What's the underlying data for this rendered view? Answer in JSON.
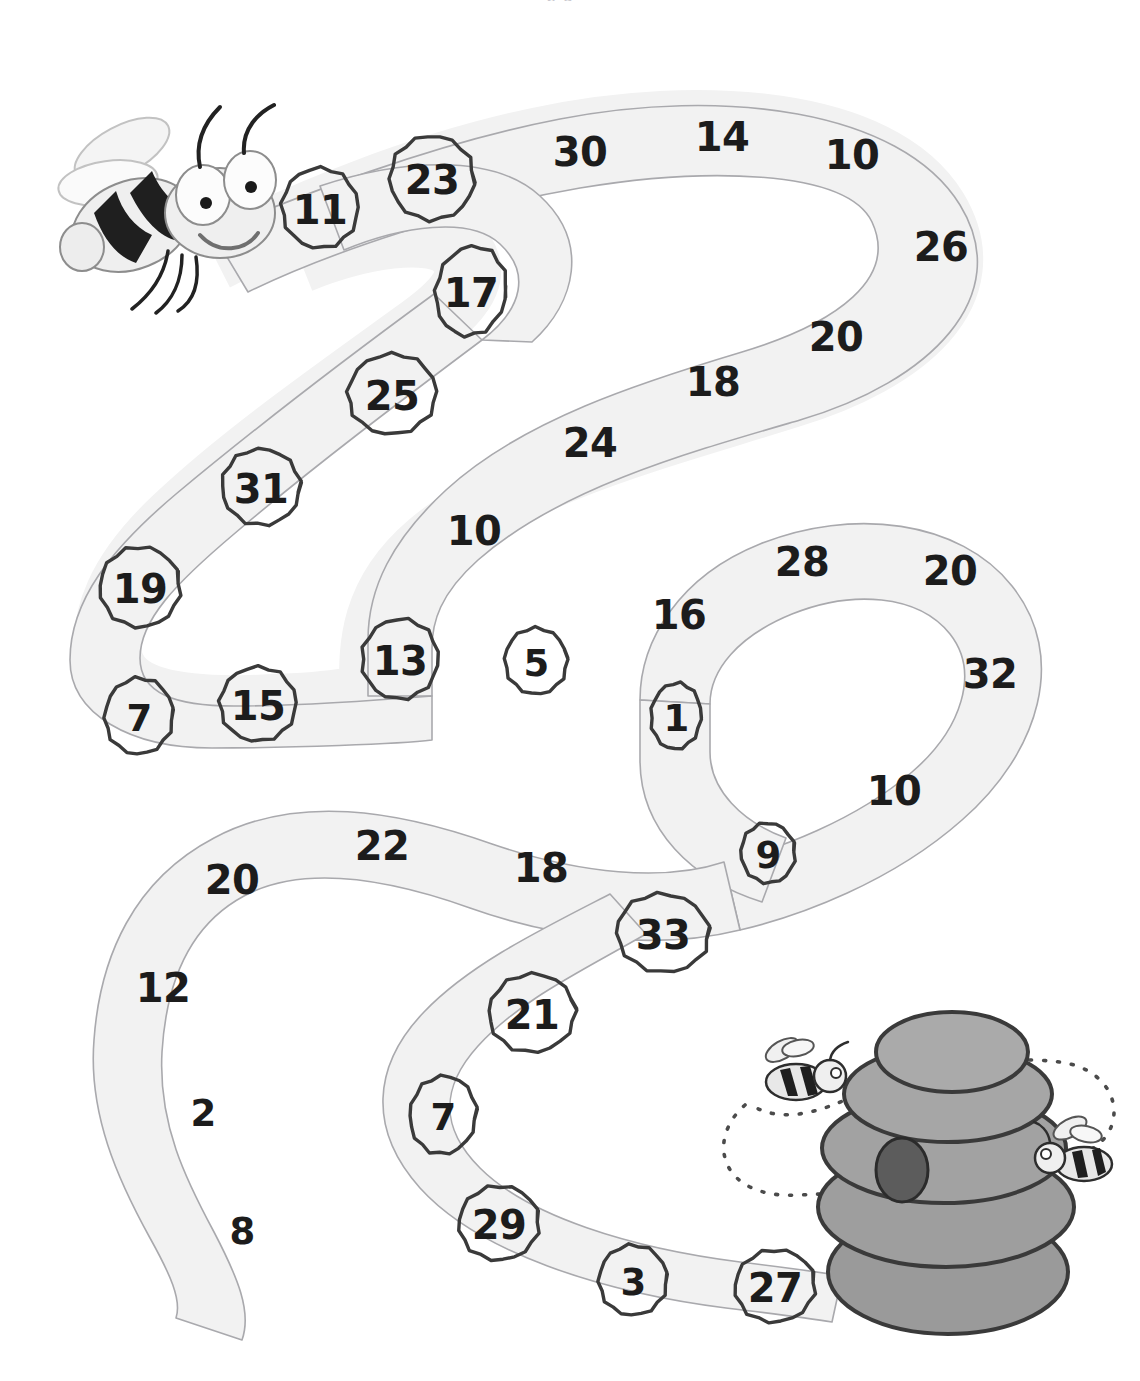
{
  "page": {
    "type": "worksheet-maze",
    "title_fragment": "p  g",
    "background_color": "#ffffff",
    "path_fill": "#f2f2f2",
    "path_stroke": "#a9a9ad",
    "number_color": "#1c1c1c",
    "ring_color": "#3a3a3a"
  },
  "illustrations": [
    {
      "name": "bee-character",
      "label": "bee",
      "x": 165,
      "y": 200,
      "width": 215,
      "height": 215
    },
    {
      "name": "beehive",
      "label": "beehive",
      "x": 945,
      "y": 1150,
      "width": 230,
      "height": 255
    },
    {
      "name": "small-bee-left",
      "label": "bee",
      "x": 795,
      "y": 1080,
      "width": 78,
      "height": 70
    },
    {
      "name": "small-bee-right",
      "label": "bee",
      "x": 1075,
      "y": 1155,
      "width": 72,
      "height": 62
    },
    {
      "name": "flight-trail",
      "label": "dotted flight path",
      "x": 905,
      "y": 1140
    }
  ],
  "numbers": [
    {
      "value": "11",
      "x": 320,
      "y": 210,
      "circled": true,
      "rx": 38,
      "ry": 40,
      "rot": -4
    },
    {
      "value": "23",
      "x": 432,
      "y": 180,
      "circled": true,
      "rx": 42,
      "ry": 42,
      "rot": 6
    },
    {
      "value": "30",
      "x": 580,
      "y": 152,
      "circled": false
    },
    {
      "value": "14",
      "x": 722,
      "y": 137,
      "circled": false
    },
    {
      "value": "10",
      "x": 852,
      "y": 155,
      "circled": false
    },
    {
      "value": "26",
      "x": 941,
      "y": 247,
      "circled": false
    },
    {
      "value": "20",
      "x": 836,
      "y": 337,
      "circled": false
    },
    {
      "value": "18",
      "x": 713,
      "y": 382,
      "circled": false
    },
    {
      "value": "24",
      "x": 590,
      "y": 443,
      "circled": false
    },
    {
      "value": "10",
      "x": 474,
      "y": 531,
      "circled": false
    },
    {
      "value": "17",
      "x": 471,
      "y": 293,
      "circled": true,
      "rx": 35,
      "ry": 45,
      "rot": 10
    },
    {
      "value": "25",
      "x": 392,
      "y": 396,
      "circled": true,
      "rx": 44,
      "ry": 40,
      "rot": -6
    },
    {
      "value": "31",
      "x": 261,
      "y": 489,
      "circled": true,
      "rx": 39,
      "ry": 38,
      "rot": 8
    },
    {
      "value": "19",
      "x": 140,
      "y": 589,
      "circled": true,
      "rx": 40,
      "ry": 40,
      "rot": -8
    },
    {
      "value": "7",
      "x": 139,
      "y": 718,
      "circled": true,
      "rx": 34,
      "ry": 38,
      "rot": 5
    },
    {
      "value": "15",
      "x": 258,
      "y": 706,
      "circled": true,
      "rx": 38,
      "ry": 37,
      "rot": -5
    },
    {
      "value": "13",
      "x": 400,
      "y": 661,
      "circled": true,
      "rx": 38,
      "ry": 40,
      "rot": 7
    },
    {
      "value": "5",
      "x": 536,
      "y": 663,
      "circled": true,
      "rx": 31,
      "ry": 33,
      "rot": -6
    },
    {
      "value": "16",
      "x": 679,
      "y": 615,
      "circled": false
    },
    {
      "value": "28",
      "x": 802,
      "y": 562,
      "circled": false
    },
    {
      "value": "20",
      "x": 950,
      "y": 571,
      "circled": false
    },
    {
      "value": "32",
      "x": 990,
      "y": 674,
      "circled": false
    },
    {
      "value": "10",
      "x": 894,
      "y": 791,
      "circled": false
    },
    {
      "value": "1",
      "x": 676,
      "y": 718,
      "circled": true,
      "rx": 25,
      "ry": 33,
      "rot": 4
    },
    {
      "value": "9",
      "x": 768,
      "y": 855,
      "circled": true,
      "rx": 27,
      "ry": 30,
      "rot": -5
    },
    {
      "value": "33",
      "x": 663,
      "y": 935,
      "circled": true,
      "rx": 46,
      "ry": 39,
      "rot": 6
    },
    {
      "value": "18",
      "x": 541,
      "y": 868,
      "circled": false
    },
    {
      "value": "22",
      "x": 382,
      "y": 846,
      "circled": false
    },
    {
      "value": "20",
      "x": 232,
      "y": 880,
      "circled": false
    },
    {
      "value": "12",
      "x": 163,
      "y": 988,
      "circled": false
    },
    {
      "value": "2",
      "x": 203,
      "y": 1113,
      "circled": false
    },
    {
      "value": "8",
      "x": 242,
      "y": 1231,
      "circled": false
    },
    {
      "value": "21",
      "x": 532,
      "y": 1015,
      "circled": true,
      "rx": 43,
      "ry": 39,
      "rot": -6
    },
    {
      "value": "7",
      "x": 443,
      "y": 1117,
      "circled": true,
      "rx": 33,
      "ry": 39,
      "rot": 7
    },
    {
      "value": "29",
      "x": 499,
      "y": 1225,
      "circled": true,
      "rx": 40,
      "ry": 37,
      "rot": -4
    },
    {
      "value": "3",
      "x": 633,
      "y": 1282,
      "circled": true,
      "rx": 34,
      "ry": 35,
      "rot": 5
    },
    {
      "value": "27",
      "x": 775,
      "y": 1288,
      "circled": true,
      "rx": 40,
      "ry": 36,
      "rot": -7
    }
  ]
}
